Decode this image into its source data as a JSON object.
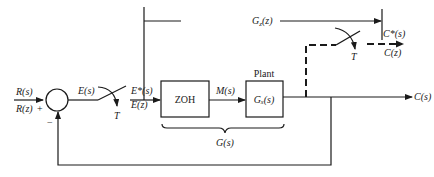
{
  "diagram": {
    "type": "sampled-data control system block diagram",
    "input": {
      "label_s": "R(s)",
      "label_z": "R(z)"
    },
    "summing_junction": {
      "plus_sign": "+",
      "minus_sign": "−"
    },
    "error_signal": "E(s)",
    "sampler_1": {
      "period_label": "T",
      "output_s": "E*(s)",
      "output_z": "E(z)"
    },
    "blocks": [
      {
        "id": "zoh",
        "label": "ZOH"
      },
      {
        "id": "plant",
        "title": "Plant",
        "label": "Gₓ(s)"
      }
    ],
    "intermediate_signal": "M(s)",
    "group_brace_label": "G(s)",
    "output": "C(s)",
    "pulse_transfer": {
      "label": "G",
      "subscript": "z",
      "suffix": "(z)"
    },
    "sampler_2": {
      "period_label": "T",
      "output_s": "C*(s)",
      "output_z": "C(z)"
    },
    "colors": {
      "line": "#1a1a1a",
      "background": "#ffffff"
    }
  }
}
